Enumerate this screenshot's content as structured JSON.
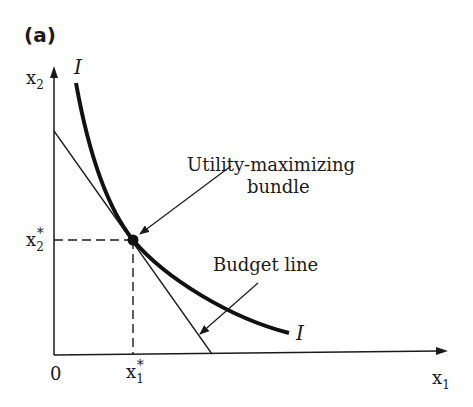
{
  "figure": {
    "panel_label": "(a)",
    "axes": {
      "y_label": "x",
      "y_label_sub": "2",
      "x_label": "x",
      "x_label_sub": "1",
      "origin_label": "0"
    },
    "curves": {
      "indifference_label_top": "I",
      "indifference_label_bottom": "I"
    },
    "optimum": {
      "x_label": "x",
      "x_label_sub": "1",
      "x_label_sup": "*",
      "y_label": "x",
      "y_label_sub": "2",
      "y_label_sup": "*"
    },
    "annotations": {
      "utility_line1": "Utility-maximizing",
      "utility_line2": "bundle",
      "budget": "Budget line"
    }
  }
}
